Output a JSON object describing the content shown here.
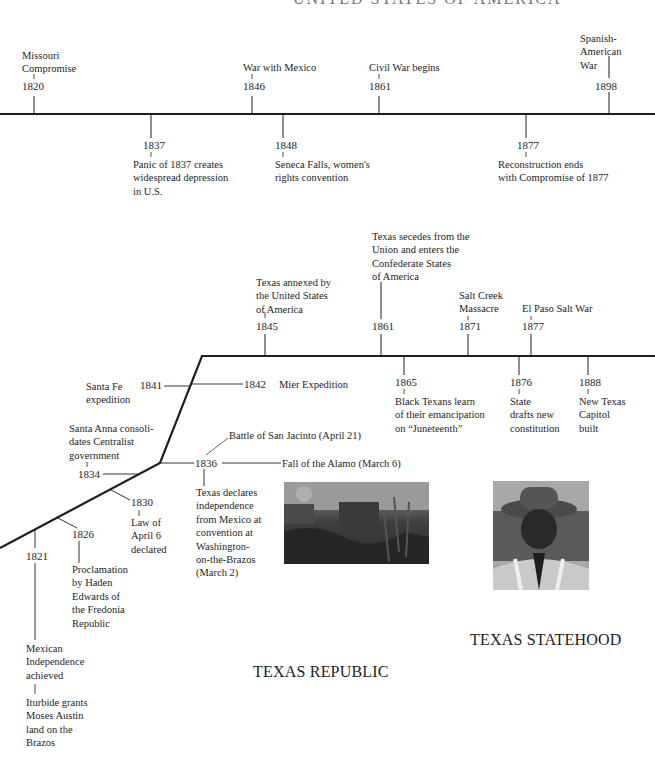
{
  "top_heading_partial": "UNITED STATES OF AMERICA",
  "us_timeline": {
    "above": [
      {
        "year": "1820",
        "label": [
          "Missouri",
          "Compromise"
        ]
      },
      {
        "year": "1846",
        "label": [
          "War with Mexico"
        ]
      },
      {
        "year": "1861",
        "label": [
          "Civil War begins"
        ]
      },
      {
        "year": "1898",
        "label": [
          "Spanish-",
          "American",
          "War"
        ]
      }
    ],
    "below": [
      {
        "year": "1837",
        "label": [
          "Panic of 1837 creates",
          "widespread depression",
          "in U.S."
        ]
      },
      {
        "year": "1848",
        "label": [
          "Seneca Falls, women's",
          "rights convention"
        ]
      },
      {
        "year": "1877",
        "label": [
          "Reconstruction ends",
          "with Compromise of 1877"
        ]
      }
    ]
  },
  "texas_timeline": {
    "statehood_above": [
      {
        "year": "1845",
        "label": [
          "Texas annexed by",
          "the United States",
          "of America"
        ]
      },
      {
        "year": "1861",
        "label": [
          "Texas secedes from the",
          "Union and enters the",
          "Confederate States",
          "of America"
        ]
      },
      {
        "year": "1871",
        "label": [
          "Salt Creek",
          "Massacre"
        ]
      },
      {
        "year": "1877",
        "label": [
          "El Paso Salt War"
        ]
      }
    ],
    "statehood_below": [
      {
        "year": "1865",
        "label": [
          "Black Texans learn",
          "of their emancipation",
          "on “Juneteenth”"
        ]
      },
      {
        "year": "1876",
        "label": [
          "State",
          "drafts new",
          "constitution"
        ]
      },
      {
        "year": "1888",
        "label": [
          "New Texas",
          "Capitol",
          "built"
        ]
      }
    ],
    "republic": [
      {
        "year": "1841",
        "label": [
          "Santa Fe",
          "expedition"
        ]
      },
      {
        "year": "1842",
        "label": [
          "Mier Expedition"
        ]
      },
      {
        "year": "1836",
        "label": [
          "Texas declares",
          "independence",
          "from Mexico at",
          "convention at",
          "Washington-",
          "on-the-Brazos",
          "(March 2)"
        ]
      },
      {
        "year": "1836",
        "label": [
          "Battle of San Jacinto (April 21)"
        ]
      },
      {
        "year": "1836",
        "label": [
          "Fall of the Alamo (March 6)"
        ]
      }
    ],
    "mexican_era": [
      {
        "year": "1834",
        "label": [
          "Santa Anna consoli-",
          "dates Centralist",
          "government"
        ]
      },
      {
        "year": "1830",
        "label": [
          "Law of",
          "April 6",
          "declared"
        ]
      },
      {
        "year": "1826",
        "label": [
          "Proclamation",
          "by Haden",
          "Edwards of",
          "the Fredonia",
          "Republic"
        ]
      },
      {
        "year": "1821",
        "label": [
          "Mexican",
          "Independence",
          "achieved"
        ],
        "sub_label": [
          "Iturbide grants",
          "Moses Austin",
          "land on the",
          "Brazos"
        ]
      }
    ]
  },
  "section_headings": {
    "statehood": "TEXAS STATEHOOD",
    "republic": "TEXAS REPUBLIC"
  },
  "images": {
    "alamo_painting": "painting-battle-scene",
    "portrait": "photo-man-in-hat"
  },
  "colors": {
    "line": "#1e1e1e",
    "text": "#1e1e1e",
    "background": "#ffffff"
  }
}
